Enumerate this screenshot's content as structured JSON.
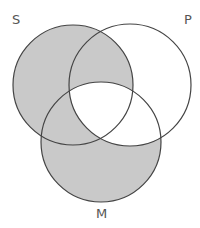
{
  "diagram": {
    "type": "venn-3",
    "labels": {
      "s": "S",
      "p": "P",
      "m": "M"
    },
    "circles": {
      "s": {
        "cx": 73,
        "cy": 85,
        "r": 60
      },
      "p": {
        "cx": 130,
        "cy": 85,
        "r": 61
      },
      "m": {
        "cx": 101,
        "cy": 142,
        "r": 60
      }
    },
    "shaded_regions": [
      "S only",
      "S and P not M",
      "S and M not P",
      "M only"
    ],
    "unshaded_regions": [
      "P only",
      "P and M not S",
      "S and P and M"
    ],
    "colors": {
      "shade": "#c9c9c9",
      "stroke": "#444444",
      "background": "#ffffff"
    }
  }
}
